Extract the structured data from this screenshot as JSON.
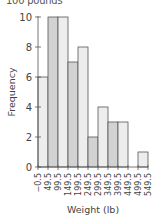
{
  "chart_data": {
    "type": "bar",
    "title": "100 pounds",
    "xlabel": "Weight (lb)",
    "ylabel": "Frequency",
    "x_ticks": [
      "−0.5",
      "49.5",
      "99.5",
      "149.5",
      "199.5",
      "249.5",
      "299.5",
      "349.5",
      "399.5",
      "449.5",
      "499.5",
      "549.5"
    ],
    "y_ticks": [
      0,
      2,
      4,
      6,
      8,
      10
    ],
    "ylim": [
      0,
      10
    ],
    "categories": [
      "-0.5–49.5",
      "49.5–99.5",
      "99.5–149.5",
      "149.5–199.5",
      "199.5–249.5",
      "249.5–299.5",
      "299.5–349.5",
      "349.5–399.5",
      "399.5–449.5",
      "449.5–499.5",
      "499.5–549.5"
    ],
    "values": [
      6,
      10,
      10,
      7,
      8,
      2,
      4,
      3,
      3,
      0,
      1
    ],
    "grid": false,
    "legend": null
  },
  "colors": {
    "bar_dark": "#d2d2d2",
    "bar_light": "#ededed",
    "outline": "#555555"
  }
}
